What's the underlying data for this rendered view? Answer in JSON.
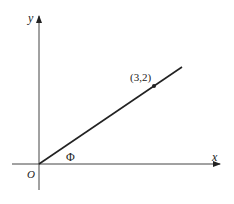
{
  "diagram": {
    "type": "coordinate-plane",
    "axes": {
      "x_label": "x",
      "y_label": "y",
      "origin_label": "O"
    },
    "line": {
      "description": "ray from origin through point",
      "point_label": "(3,2)",
      "point": [
        3,
        2
      ]
    },
    "angle_label": "Φ",
    "colors": {
      "stroke": "#222222",
      "axis": "#444444",
      "background": "#ffffff"
    }
  }
}
